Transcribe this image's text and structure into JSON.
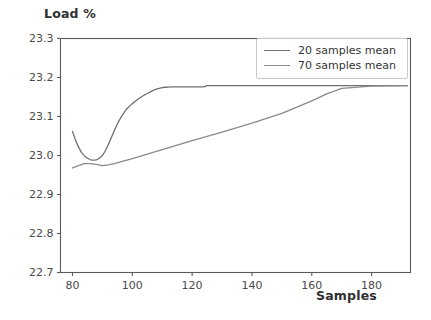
{
  "chart_data": {
    "type": "line",
    "title": "",
    "xlabel": "Samples",
    "ylabel": "Load %",
    "xlim": [
      76,
      193
    ],
    "ylim": [
      22.7,
      23.3
    ],
    "xticks": [
      80,
      100,
      120,
      140,
      160,
      180
    ],
    "xtick_labels": [
      "80",
      "100",
      "120",
      "140",
      "160",
      "180"
    ],
    "yticks": [
      22.7,
      22.8,
      22.9,
      23.0,
      23.1,
      23.2,
      23.3
    ],
    "ytick_labels": [
      "22.7",
      "22.8",
      "22.9",
      "23.0",
      "23.1",
      "23.2",
      "23.3"
    ],
    "grid": false,
    "legend_position": "upper right",
    "series": [
      {
        "name": "20 samples mean",
        "color": "#6f6f6f",
        "x": [
          80,
          81,
          82,
          83,
          84,
          85,
          86,
          87,
          88,
          89,
          90,
          91,
          92,
          93,
          94,
          95,
          96,
          97,
          98,
          99,
          100,
          101,
          102,
          103,
          104,
          105,
          106,
          107,
          108,
          109,
          110,
          111,
          112,
          113,
          114,
          115,
          120,
          124,
          125,
          126,
          140,
          160,
          180,
          192
        ],
        "y": [
          23.062,
          23.04,
          23.022,
          23.008,
          22.999,
          22.993,
          22.989,
          22.988,
          22.989,
          22.993,
          23.0,
          23.012,
          23.028,
          23.046,
          23.064,
          23.081,
          23.095,
          23.107,
          23.118,
          23.126,
          23.133,
          23.139,
          23.145,
          23.15,
          23.155,
          23.159,
          23.163,
          23.167,
          23.17,
          23.172,
          23.174,
          23.175,
          23.1755,
          23.176,
          23.176,
          23.176,
          23.176,
          23.176,
          23.179,
          23.179,
          23.179,
          23.179,
          23.179,
          23.179
        ]
      },
      {
        "name": "70 samples mean",
        "color": "#8a8a8a",
        "x": [
          80,
          82,
          84,
          86,
          88,
          90,
          92,
          94,
          100,
          110,
          120,
          130,
          140,
          150,
          160,
          165,
          170,
          180,
          192
        ],
        "y": [
          22.968,
          22.974,
          22.979,
          22.979,
          22.977,
          22.974,
          22.976,
          22.979,
          22.992,
          23.015,
          23.038,
          23.06,
          23.083,
          23.108,
          23.14,
          23.158,
          23.172,
          23.178,
          23.179
        ]
      }
    ]
  },
  "legend": {
    "entries": [
      {
        "label": "20 samples mean",
        "color": "#6f6f6f"
      },
      {
        "label": "70 samples mean",
        "color": "#8a8a8a"
      }
    ]
  },
  "axes": {
    "frame_color": "#5a5a5a",
    "tick_color": "#5a5a5a"
  }
}
